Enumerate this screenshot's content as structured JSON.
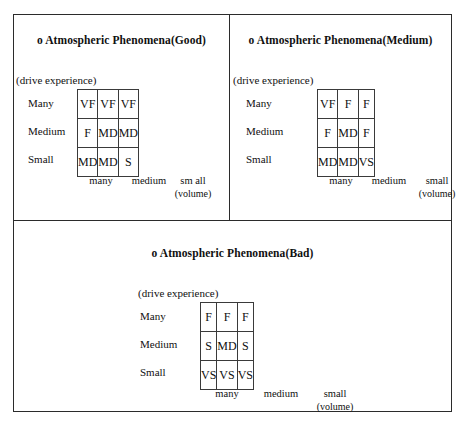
{
  "figure": {
    "panels": [
      {
        "id": "good",
        "title": "o Atmospheric Phenomena(Good)",
        "axis_note": "(drive experience)",
        "row_labels": [
          "Many",
          "Medium",
          "Small"
        ],
        "col_labels": [
          "many",
          "medium",
          "small"
        ],
        "col_label_third_wrapped": "sm all",
        "unit_label": "(volume)",
        "rows": [
          [
            "VF",
            "VF",
            "VF"
          ],
          [
            "F",
            "MD",
            "MD"
          ],
          [
            "MD",
            "MD",
            "S"
          ]
        ]
      },
      {
        "id": "medium",
        "title": "o Atmospheric Phenomena(Medium)",
        "axis_note": "(drive experience)",
        "row_labels": [
          "Many",
          "Medium",
          "Small"
        ],
        "col_labels": [
          "many",
          "medium",
          "small"
        ],
        "unit_label": "(volume)",
        "rows": [
          [
            "VF",
            "F",
            "F"
          ],
          [
            "F",
            "MD",
            "F"
          ],
          [
            "MD",
            "MD",
            "VS"
          ]
        ]
      },
      {
        "id": "bad",
        "title": "o Atmospheric Phenomena(Bad)",
        "axis_note": "(drive experience)",
        "row_labels": [
          "Many",
          "Medium",
          "Small"
        ],
        "col_labels": [
          "many",
          "medium",
          "small"
        ],
        "unit_label": "(volume)",
        "rows": [
          [
            "F",
            "F",
            "F"
          ],
          [
            "S",
            "MD",
            "S"
          ],
          [
            "VS",
            "VS",
            "VS"
          ]
        ]
      }
    ]
  },
  "chart_data": {
    "type": "table",
    "xlabel": "(volume)",
    "ylabel": "(drive experience)",
    "row_categories": [
      "Many",
      "Medium",
      "Small"
    ],
    "column_categories": [
      "many",
      "medium",
      "small"
    ],
    "tables": [
      {
        "name": "Atmospheric Phenomena(Good)",
        "cells": [
          [
            "VF",
            "VF",
            "VF"
          ],
          [
            "F",
            "MD",
            "MD"
          ],
          [
            "MD",
            "MD",
            "S"
          ]
        ]
      },
      {
        "name": "Atmospheric Phenomena(Medium)",
        "cells": [
          [
            "VF",
            "F",
            "F"
          ],
          [
            "F",
            "MD",
            "F"
          ],
          [
            "MD",
            "MD",
            "VS"
          ]
        ]
      },
      {
        "name": "Atmospheric Phenomena(Bad)",
        "cells": [
          [
            "F",
            "F",
            "F"
          ],
          [
            "S",
            "MD",
            "S"
          ],
          [
            "VS",
            "VS",
            "VS"
          ]
        ]
      }
    ],
    "legend": [
      "VF",
      "F",
      "MD",
      "S",
      "VS"
    ],
    "grid": true
  }
}
